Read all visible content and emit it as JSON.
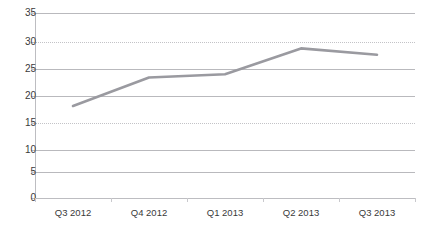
{
  "chart_data": {
    "type": "line",
    "title": "",
    "title_note": "cut off at top edge of screenshot, illegible",
    "xlabel": "",
    "ylabel": "",
    "categories": [
      "Q3 2012",
      "Q4 2012",
      "Q1 2013",
      "Q2 2013",
      "Q3 2013"
    ],
    "series": [
      {
        "name": "series-1",
        "values": [
          17.4,
          22.8,
          23.4,
          28.3,
          27.1
        ],
        "color": "#9a9aa0"
      }
    ],
    "ylim": [
      0,
      35
    ],
    "ytick_step": 5,
    "yticks": [
      0,
      5,
      10,
      15,
      20,
      25,
      30,
      35
    ],
    "ytick_labels": [
      "0",
      "5",
      "10",
      "15",
      "20",
      "25",
      "30",
      "35"
    ],
    "grid": true,
    "grid_axis": "y",
    "legend": false,
    "legend_position": "none",
    "markers": false
  },
  "axes": {
    "y_labels": [
      "35",
      "30",
      "25",
      "20",
      "15",
      "10",
      "5",
      "0"
    ],
    "x_labels": [
      "Q3 2012",
      "Q4 2012",
      "Q1 2013",
      "Q2 2013",
      "Q3 2013"
    ]
  },
  "colors": {
    "line": "#9a9aa0",
    "grid": "#b9b9bd",
    "axis": "#bdbdc1",
    "text": "#3a3a3a",
    "background": "#ffffff"
  },
  "title_fragment": ""
}
